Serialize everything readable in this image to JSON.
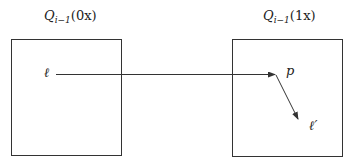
{
  "diagram": {
    "boxes": [
      {
        "id": "left",
        "label_main": "Q",
        "label_sub": "i−1",
        "label_arg": "(0x)",
        "x": 11,
        "y": 39,
        "w": 110,
        "h": 116
      },
      {
        "id": "right",
        "label_main": "Q",
        "label_sub": "i−1",
        "label_arg": "(1x)",
        "x": 232,
        "y": 39,
        "w": 110,
        "h": 117
      }
    ],
    "points": {
      "ell": {
        "label": "ℓ"
      },
      "p": {
        "label": "p"
      },
      "ell_prime": {
        "label": "ℓ′"
      }
    },
    "arrows": [
      {
        "from": "ell",
        "to": "p",
        "x1": 56,
        "y1": 74,
        "x2": 275,
        "y2": 74
      },
      {
        "from": "p",
        "to": "ell_prime",
        "x1": 276,
        "y1": 75,
        "x2": 298,
        "y2": 119
      }
    ],
    "stroke_color": "#333333"
  }
}
